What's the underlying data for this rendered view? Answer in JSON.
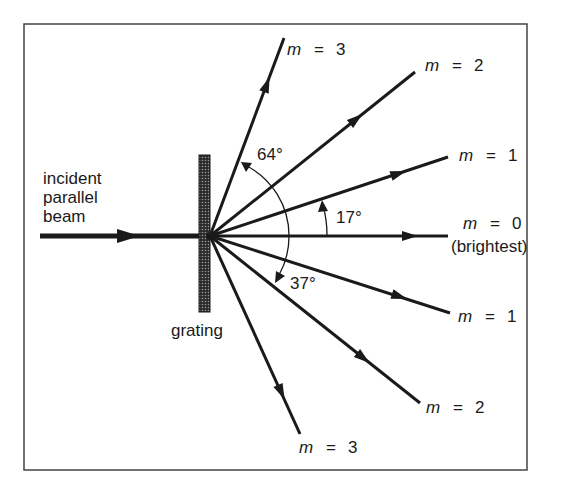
{
  "diagram": {
    "frame": {
      "x": 24,
      "y": 24,
      "width": 503,
      "height": 446
    },
    "origin": {
      "x": 210,
      "y": 236
    },
    "grating": {
      "label": "grating",
      "x": 199,
      "y": 155,
      "width": 11,
      "height": 157
    },
    "incident_beam": {
      "label_lines": [
        "incident",
        "parallel",
        "beam"
      ],
      "x1": 40,
      "x2": 210,
      "y": 236
    },
    "rays": [
      {
        "id": "m0",
        "label": "m = 0",
        "sublabel": "(brightest)",
        "end": [
          448,
          236
        ],
        "angle_deg": 0
      },
      {
        "id": "m1-up",
        "label": "m = 1",
        "end": [
          448,
          157
        ],
        "angle_deg": 17
      },
      {
        "id": "m2-up",
        "label": "m = 2",
        "end": [
          415,
          72
        ],
        "angle_deg": 39
      },
      {
        "id": "m3-up",
        "label": "m = 3",
        "end": [
          284,
          38
        ],
        "angle_deg": 64
      },
      {
        "id": "m1-down",
        "label": "m = 1",
        "end": [
          450,
          313
        ],
        "angle_deg": -17
      },
      {
        "id": "m2-down",
        "label": "m = 2",
        "end": [
          420,
          403
        ],
        "angle_deg": -37
      },
      {
        "id": "m3-down",
        "label": "m = 3",
        "end": [
          300,
          434
        ],
        "angle_deg": -64
      }
    ],
    "angles": [
      {
        "label": "64°",
        "between": [
          "m0",
          "m3-up"
        ]
      },
      {
        "label": "17°",
        "between": [
          "m0",
          "m1-up"
        ]
      },
      {
        "label": "37°",
        "between": [
          "m0",
          "m2-down"
        ]
      }
    ],
    "labels": {
      "m3_up": {
        "m": "m",
        "eq": "=",
        "n": "3"
      },
      "m2_up": {
        "m": "m",
        "eq": "=",
        "n": "2"
      },
      "m1_up": {
        "m": "m",
        "eq": "=",
        "n": "1"
      },
      "m0": {
        "m": "m",
        "eq": "=",
        "n": "0",
        "note": "(brightest)"
      },
      "m1_down": {
        "m": "m",
        "eq": "=",
        "n": "1"
      },
      "m2_down": {
        "m": "m",
        "eq": "=",
        "n": "2"
      },
      "m3_down": {
        "m": "m",
        "eq": "=",
        "n": "3"
      },
      "angle_64": "64°",
      "angle_17": "17°",
      "angle_37": "37°",
      "incident": [
        "incident",
        "parallel",
        "beam"
      ],
      "grating": "grating"
    },
    "colors": {
      "ink": "#1a1a1a",
      "frame": "#444444",
      "background": "#ffffff"
    }
  }
}
